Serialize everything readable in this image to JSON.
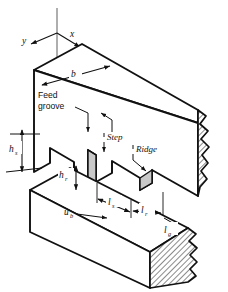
{
  "figure": {
    "background_color": "#ffffff",
    "line_color": "#111111",
    "hatch_color": "#2b2b2b",
    "shade_color": "#c9c9c9",
    "axis_color": "#9a9a9a"
  },
  "axes": {
    "x_label": "x",
    "y_label": "y",
    "vertical_axis_label": ""
  },
  "callouts": {
    "feed_groove_line1": "Feed",
    "feed_groove_line2": "groove",
    "step_label": "Step",
    "ridge_label": "Ridge"
  },
  "dimensions": [
    {
      "id": "b",
      "symbol": "b",
      "subscript": "",
      "description": "bearing width"
    },
    {
      "id": "hs",
      "symbol": "h",
      "subscript": "s",
      "description": "step height"
    },
    {
      "id": "hr",
      "symbol": "h",
      "subscript": "r",
      "description": "ridge height"
    },
    {
      "id": "ls",
      "symbol": "l",
      "subscript": "s",
      "description": "step length"
    },
    {
      "id": "lr",
      "symbol": "l",
      "subscript": "r",
      "description": "ridge length"
    },
    {
      "id": "lg",
      "symbol": "l",
      "subscript": "g",
      "description": "groove length"
    }
  ],
  "velocity": {
    "symbol": "u",
    "subscript": "b",
    "description": "slider surface velocity",
    "direction": "right"
  }
}
